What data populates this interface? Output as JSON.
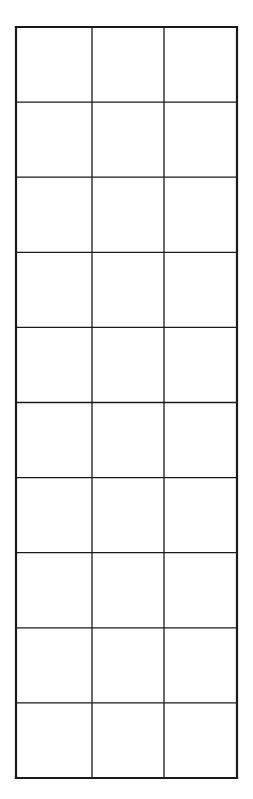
{
  "grid": {
    "rows": 10,
    "cols": 3,
    "left": 16,
    "top": 27,
    "right": 237,
    "bottom": 778,
    "col_lines": [
      16,
      92,
      164,
      237
    ],
    "line_color": "#1a1a1a",
    "outer_stroke": 2.2,
    "inner_stroke": 1.3,
    "background": "#ffffff"
  }
}
